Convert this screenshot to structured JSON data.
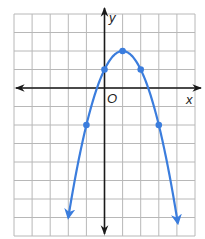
{
  "chart_data": {
    "type": "line",
    "title": "",
    "xlabel": "x",
    "ylabel": "y",
    "origin_label": "O",
    "xlim": [
      -5,
      5
    ],
    "ylim": [
      -8,
      4
    ],
    "grid": true,
    "function": "y = -(x - 1)^2 + 2",
    "series": [
      {
        "name": "parabola",
        "color": "#3b7ddd",
        "x": [
          -2,
          -1,
          0,
          1,
          2,
          3,
          4
        ],
        "y": [
          -7,
          -2,
          1,
          2,
          1,
          -2,
          -7
        ],
        "marked_points": [
          [
            -1,
            -2
          ],
          [
            0,
            1
          ],
          [
            1,
            2
          ],
          [
            2,
            1
          ],
          [
            3,
            -2
          ]
        ],
        "arrows_at_ends": true
      }
    ]
  },
  "colors": {
    "curve": "#3b7ddd",
    "grid": "#b8b8b8",
    "axis": "#1a1a1a"
  }
}
